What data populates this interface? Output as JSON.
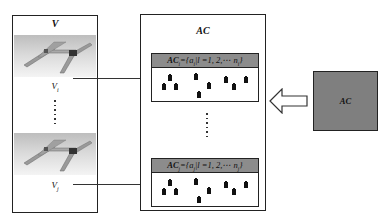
{
  "diagram": {
    "vehicle_set": {
      "title": "V",
      "items": [
        {
          "label_base": "V",
          "label_sub": "i",
          "image": "robot-gantry-image"
        },
        {
          "label_base": "V",
          "label_sub": "j",
          "image": "robot-gantry-image"
        }
      ],
      "ellipsis": "......"
    },
    "agent_cluster": {
      "title": "AC",
      "subsets": [
        {
          "head_prefix": "AC",
          "head_sub": "i",
          "head_rest": "={a",
          "elem_sub": "i",
          "cond": "|l =1, 2,⋯ n",
          "n_sub": "i",
          "close": "}",
          "agent_count": 9
        },
        {
          "head_prefix": "AC",
          "head_sub": "j",
          "head_rest": "={a",
          "elem_sub": "j",
          "cond": "|l =1, 2,⋯ n",
          "n_sub": "j",
          "close": "}",
          "agent_count": 9
        }
      ],
      "ellipsis": "......"
    },
    "source_block": {
      "label": "AC",
      "fill_color": "#7f7f7f"
    },
    "arrows": [
      {
        "from": "V_i",
        "to": "AC_i",
        "type": "line-arrow"
      },
      {
        "from": "V_j",
        "to": "AC_j",
        "type": "line-arrow"
      },
      {
        "from": "AC-block",
        "to": "AC-cluster",
        "type": "hollow-block-arrow"
      }
    ],
    "colors": {
      "stroke": "#222222",
      "header_fill": "#8c8c8c",
      "block_fill": "#7f7f7f",
      "background": "#ffffff"
    }
  }
}
